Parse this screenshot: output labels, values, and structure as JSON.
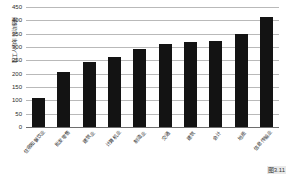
{
  "caption": "图3.11",
  "chart_data": {
    "type": "bar",
    "title": "",
    "xlabel": "",
    "ylabel": "职工人均年劳动报酬",
    "ylim": [
      0,
      450
    ],
    "ytick_values": [
      450,
      400,
      350,
      300,
      250,
      200,
      150,
      100,
      50,
      0
    ],
    "ytick_labels": [
      "450",
      "400",
      "350",
      "300",
      "250",
      "200",
      "150",
      "100",
      "50",
      "0"
    ],
    "grid": true,
    "legend": "none",
    "bar_color": "#131313",
    "categories": [
      "住宿和餐饮业",
      "批发零售",
      "建筑业",
      "计算机业",
      "制造业",
      "交通",
      "建筑",
      "会计",
      "地质",
      "信息传输业"
    ],
    "values": [
      108,
      208,
      245,
      264,
      293,
      313,
      320,
      324,
      349,
      411
    ]
  }
}
